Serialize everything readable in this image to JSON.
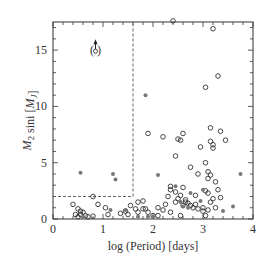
{
  "chart_data": {
    "type": "scatter",
    "title": "",
    "xlabel": "log (Period) [days]",
    "ylabel": "M2 sini [MJ]",
    "xlim": [
      0,
      4
    ],
    "ylim": [
      0,
      17.5
    ],
    "xticks": [
      0,
      1,
      2,
      3,
      4
    ],
    "yticks": [
      0,
      5,
      10,
      15
    ],
    "grid": false,
    "legend": null,
    "annotations": [
      {
        "type": "dashed-box",
        "x0": 0,
        "x1": 1.6,
        "y0": 2.0,
        "y1": 17.5
      },
      {
        "type": "arrow-point-in-parentheses",
        "x": 0.85,
        "y": 15.0,
        "label": "(o)"
      }
    ],
    "series": [
      {
        "name": "open",
        "marker": "open-circle",
        "points": [
          [
            2.4,
            17.6
          ],
          [
            3.2,
            16.9
          ],
          [
            3.3,
            12.7
          ],
          [
            3.05,
            11.7
          ],
          [
            3.15,
            8.1
          ],
          [
            2.6,
            7.6
          ],
          [
            3.35,
            7.8
          ],
          [
            2.5,
            7.1
          ],
          [
            1.9,
            7.6
          ],
          [
            2.2,
            7.3
          ],
          [
            2.55,
            7.0
          ],
          [
            3.15,
            6.9
          ],
          [
            3.2,
            6.6
          ],
          [
            3.2,
            6.3
          ],
          [
            3.45,
            7.0
          ],
          [
            2.95,
            6.4
          ],
          [
            2.45,
            5.6
          ],
          [
            3.05,
            5.0
          ],
          [
            2.75,
            4.6
          ],
          [
            2.9,
            4.0
          ],
          [
            3.1,
            4.2
          ],
          [
            3.15,
            3.9
          ],
          [
            3.25,
            3.3
          ],
          [
            3.1,
            3.6
          ],
          [
            2.6,
            2.8
          ],
          [
            2.35,
            2.9
          ],
          [
            2.35,
            2.6
          ],
          [
            2.45,
            2.4
          ],
          [
            2.5,
            1.8
          ],
          [
            2.55,
            2.1
          ],
          [
            2.65,
            1.7
          ],
          [
            2.7,
            1.4
          ],
          [
            2.75,
            1.2
          ],
          [
            2.8,
            1.0
          ],
          [
            2.6,
            1.2
          ],
          [
            2.65,
            1.5
          ],
          [
            2.85,
            1.3
          ],
          [
            2.9,
            0.9
          ],
          [
            3.0,
            1.0
          ],
          [
            3.05,
            2.5
          ],
          [
            3.1,
            2.3
          ],
          [
            3.15,
            1.5
          ],
          [
            3.2,
            1.8
          ],
          [
            3.3,
            2.6
          ],
          [
            3.35,
            1.9
          ],
          [
            3.1,
            0.8
          ],
          [
            3.0,
            0.7
          ],
          [
            2.35,
            0.6
          ],
          [
            2.2,
            0.8
          ],
          [
            2.1,
            1.0
          ],
          [
            2.0,
            0.3
          ],
          [
            2.1,
            0.3
          ],
          [
            2.55,
            0.3
          ],
          [
            3.05,
            0.3
          ],
          [
            1.55,
            1.2
          ],
          [
            1.7,
            1.5
          ],
          [
            1.8,
            1.6
          ],
          [
            1.8,
            0.9
          ],
          [
            1.65,
            0.9
          ],
          [
            2.25,
            1.3
          ],
          [
            2.3,
            2.0
          ],
          [
            2.45,
            1.5
          ],
          [
            2.85,
            2.1
          ],
          [
            3.25,
            1.0
          ],
          [
            0.4,
            1.3
          ],
          [
            0.5,
            0.9
          ],
          [
            0.55,
            0.7
          ],
          [
            0.6,
            0.6
          ],
          [
            0.45,
            0.4
          ],
          [
            0.55,
            0.4
          ],
          [
            0.65,
            0.3
          ],
          [
            0.5,
            0.2
          ],
          [
            0.7,
            0.2
          ],
          [
            0.8,
            0.25
          ],
          [
            0.8,
            2.0
          ],
          [
            0.9,
            1.3
          ],
          [
            1.05,
            1.0
          ],
          [
            1.1,
            0.4
          ],
          [
            1.35,
            0.5
          ],
          [
            1.45,
            0.7
          ],
          [
            1.5,
            0.4
          ],
          [
            1.7,
            0.6
          ],
          [
            1.85,
            0.9
          ],
          [
            1.9,
            0.6
          ]
        ]
      },
      {
        "name": "filled",
        "marker": "filled-circle",
        "points": [
          [
            0.55,
            4.1
          ],
          [
            1.2,
            4.0
          ],
          [
            1.25,
            3.5
          ],
          [
            1.85,
            11.0
          ],
          [
            2.1,
            3.9
          ],
          [
            2.45,
            2.9
          ],
          [
            2.75,
            2.3
          ],
          [
            2.95,
            1.6
          ],
          [
            3.0,
            2.6
          ],
          [
            3.75,
            4.0
          ],
          [
            3.6,
            1.1
          ],
          [
            3.4,
            0.7
          ],
          [
            2.55,
            1.5
          ],
          [
            2.6,
            1.1
          ],
          [
            2.7,
            1.0
          ],
          [
            1.15,
            0.8
          ],
          [
            1.45,
            0.8
          ],
          [
            1.7,
            0.2
          ],
          [
            1.9,
            0.2
          ],
          [
            2.0,
            0.2
          ],
          [
            0.6,
            0.2
          ]
        ]
      }
    ]
  }
}
